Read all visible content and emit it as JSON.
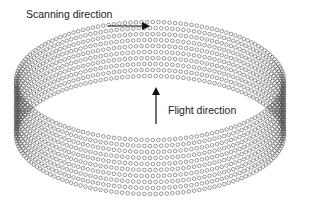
{
  "diagram": {
    "labels": {
      "scanning": "Scanning direction",
      "flight": "Flight direction"
    },
    "arrows": {
      "scanning": {
        "x1": 108,
        "y1": 26,
        "x2": 148,
        "y2": 26
      },
      "flight": {
        "x1": 156,
        "y1": 124,
        "x2": 156,
        "y2": 89
      }
    },
    "cylinder": {
      "cx": 150,
      "cy": 81,
      "rx": 134,
      "ry": 59,
      "rows": 10,
      "row_spacing": 6.0,
      "dots_per_row": 150,
      "dot_radius": 1.8,
      "stroke_color": "#555555"
    },
    "colors": {
      "text": "#222222",
      "arrow": "#111111",
      "dots": "#555555",
      "background": "#ffffff"
    }
  }
}
